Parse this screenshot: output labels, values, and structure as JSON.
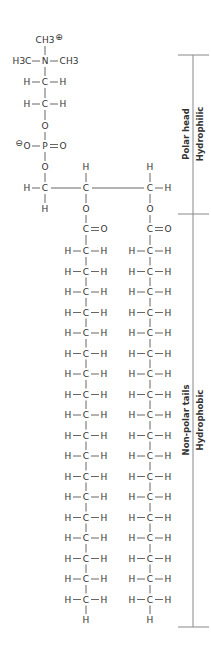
{
  "molecule": "phosphatidylcholine",
  "head": {
    "top_group": "CH3",
    "top_charge": "⊕",
    "n_row": {
      "left": "H3C",
      "center": "N",
      "right": "CH3"
    },
    "ch2_rows": [
      {
        "left": "H",
        "center": "C",
        "right": "H"
      },
      {
        "left": "H",
        "center": "C",
        "right": "H"
      }
    ],
    "ester_o_upper": "O",
    "phosphate": {
      "charge": "⊖",
      "left": "O",
      "center": "P",
      "right": "O"
    },
    "ester_o_lower": "O"
  },
  "glycerol": {
    "c1": {
      "left": "H",
      "center": "C",
      "below": "H"
    },
    "c2": {
      "above": "H",
      "center": "C",
      "below": "O"
    },
    "c3": {
      "above": "H",
      "center": "C",
      "right": "H",
      "below": "O"
    }
  },
  "tails": [
    {
      "carbonyl": {
        "c": "C",
        "o": "O"
      },
      "ch2_count": 18,
      "terminal": "H",
      "atom_h": "H",
      "atom_c": "C"
    },
    {
      "carbonyl": {
        "c": "C",
        "o": "O"
      },
      "ch2_count": 18,
      "terminal": "H",
      "atom_h": "H",
      "atom_c": "C"
    }
  ],
  "regions": [
    {
      "title": "Polar head",
      "subtitle": "Hydrophilic"
    },
    {
      "title": "Non-polar tails",
      "subtitle": "Hydrophobic"
    }
  ],
  "colors": {
    "text": "#333333",
    "bond": "#555555",
    "bracket": "#888888"
  }
}
